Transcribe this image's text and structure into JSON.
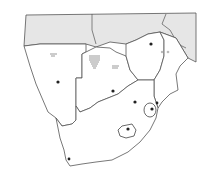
{
  "map": {
    "region": "Southern Africa",
    "style": "black-and-white outline map",
    "colors": {
      "background": "#ffffff",
      "northern_countries_fill": "#e6e6e6",
      "border": "#555555",
      "capital_dot": "#222222"
    },
    "regions": [
      {
        "id": "north-shaded",
        "fill": "shaded"
      },
      {
        "id": "namibia-like",
        "fill": "white",
        "capital": true,
        "marsh_marks": true
      },
      {
        "id": "botswana-like",
        "fill": "white",
        "capital": true,
        "marsh_marks": true
      },
      {
        "id": "zimbabwe-like",
        "fill": "white",
        "capital": true
      },
      {
        "id": "mozambique-like",
        "fill": "white"
      },
      {
        "id": "south-africa-like",
        "fill": "white",
        "capital_count": 2
      },
      {
        "id": "eswatini-like-enclave",
        "fill": "white",
        "capital": true
      },
      {
        "id": "lesotho-like-enclave",
        "fill": "white",
        "capital": true
      }
    ],
    "labels": []
  }
}
